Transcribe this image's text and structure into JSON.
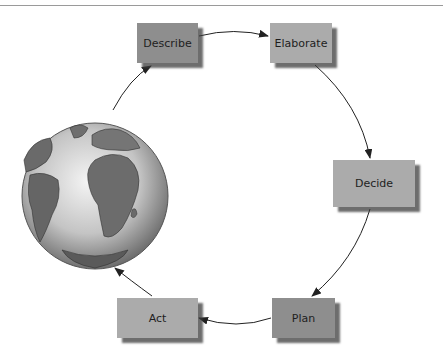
{
  "diagram": {
    "type": "cycle",
    "nodes": [
      {
        "id": "describe",
        "label": "Describe",
        "shade": "dark"
      },
      {
        "id": "elaborate",
        "label": "Elaborate",
        "shade": "light"
      },
      {
        "id": "decide",
        "label": "Decide",
        "shade": "light"
      },
      {
        "id": "plan",
        "label": "Plan",
        "shade": "dark"
      },
      {
        "id": "act",
        "label": "Act",
        "shade": "light"
      }
    ],
    "edges": [
      {
        "from": "describe",
        "to": "elaborate"
      },
      {
        "from": "elaborate",
        "to": "decide"
      },
      {
        "from": "decide",
        "to": "plan"
      },
      {
        "from": "plan",
        "to": "act"
      },
      {
        "from": "act",
        "to": "globe"
      },
      {
        "from": "globe",
        "to": "describe"
      }
    ],
    "center_image": "globe-icon",
    "colors": {
      "dark_box": "#8e8e8e",
      "light_box": "#ababab",
      "arrow": "#222222"
    }
  }
}
